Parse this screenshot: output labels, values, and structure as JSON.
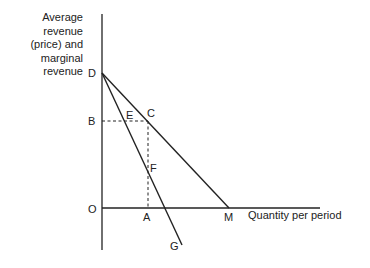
{
  "diagram": {
    "y_axis_label_lines": [
      "Average",
      "revenue",
      "(price) and",
      "marginal",
      "revenue"
    ],
    "x_axis_label": "Quantity per period",
    "points": {
      "D": "D",
      "B": "B",
      "E": "E",
      "C": "C",
      "F": "F",
      "O": "O",
      "A": "A",
      "M": "M",
      "G": "G"
    },
    "lines": [
      {
        "name": "average-revenue-line",
        "from": "D",
        "to": "M",
        "style": "solid"
      },
      {
        "name": "marginal-revenue-line",
        "from": "D",
        "to": "G",
        "style": "solid"
      },
      {
        "name": "price-dashed-line",
        "from": "B",
        "to": "C",
        "style": "dashed"
      },
      {
        "name": "quantity-dashed-line",
        "from": "C",
        "to": "A",
        "style": "dashed"
      }
    ],
    "colors": {
      "line": "#222222",
      "background": "#ffffff"
    }
  }
}
